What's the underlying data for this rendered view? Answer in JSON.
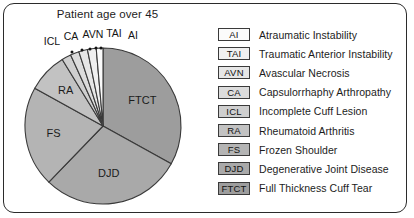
{
  "figure": {
    "background": "#ffffff",
    "border_color": "#2b2b2b"
  },
  "chart_data": {
    "type": "pie",
    "title": "Patient age over 45",
    "xlabel": "",
    "ylabel": "",
    "legend_position": "right",
    "grid": false,
    "start_angle_deg": 0,
    "direction": "clockwise",
    "categories": [
      "FTCT",
      "DJD",
      "FS",
      "RA",
      "ICL",
      "CA",
      "AVN",
      "TAI",
      "AI"
    ],
    "values": [
      33,
      29,
      21,
      8,
      2,
      2,
      2,
      2,
      1
    ],
    "labels_on_slices": [
      "FTCT",
      "DJD",
      "FS",
      "RA"
    ],
    "labels_with_leader_lines": [
      "ICL",
      "CA",
      "AVN",
      "TAI",
      "AI"
    ],
    "slice_colors": [
      "#9d9d9d",
      "#a9a9a9",
      "#b4b4b4",
      "#c2c2c2",
      "#cfcfcf",
      "#dcdcdc",
      "#e6e6e6",
      "#f0f0f0",
      "#fbfbfb"
    ],
    "series": [
      {
        "name": "Patient age over 45",
        "values": [
          33,
          29,
          21,
          8,
          2,
          2,
          2,
          2,
          1
        ]
      }
    ]
  },
  "pie": {
    "center_x": 103,
    "center_y": 126,
    "radius": 78,
    "outline_color": "#3a3a3a",
    "slices": [
      {
        "key": "FTCT",
        "start": 0,
        "end": 119,
        "fill": "#9d9d9d",
        "label": "FTCT",
        "label_r": 47,
        "label_angle": 57
      },
      {
        "key": "DJD",
        "start": 119,
        "end": 224,
        "fill": "#a9a9a9",
        "label": "DJD",
        "label_r": 47,
        "label_angle": 173
      },
      {
        "key": "FS",
        "start": 224,
        "end": 299,
        "fill": "#b4b4b4",
        "label": "FS",
        "label_r": 50,
        "label_angle": 262
      },
      {
        "key": "RA",
        "start": 299,
        "end": 328.5,
        "fill": "#c2c2c2",
        "label": "RA",
        "label_r": 52,
        "label_angle": 314
      },
      {
        "key": "ICL",
        "start": 328.5,
        "end": 335.5,
        "fill": "#cfcfcf",
        "label": "",
        "label_r": 0,
        "label_angle": 0
      },
      {
        "key": "CA",
        "start": 335.5,
        "end": 342,
        "fill": "#dcdcdc",
        "label": "",
        "label_r": 0,
        "label_angle": 0
      },
      {
        "key": "AVN",
        "start": 342,
        "end": 348.5,
        "fill": "#e6e6e6",
        "label": "",
        "label_r": 0,
        "label_angle": 0
      },
      {
        "key": "TAI",
        "start": 348.5,
        "end": 355,
        "fill": "#f0f0f0",
        "label": "",
        "label_r": 0,
        "label_angle": 0
      },
      {
        "key": "AI",
        "start": 355,
        "end": 360,
        "fill": "#fbfbfb",
        "label": "",
        "label_r": 0,
        "label_angle": 0
      }
    ],
    "callouts": [
      {
        "key": "ICL",
        "label": "ICL",
        "text_x": 52,
        "text_y": 45,
        "dot_x": 72,
        "dot_y": 52
      },
      {
        "key": "CA",
        "label": "CA",
        "text_x": 71,
        "text_y": 40,
        "dot_x": 82,
        "dot_y": 50
      },
      {
        "key": "AVN",
        "label": "AVN",
        "text_x": 93,
        "text_y": 38,
        "dot_x": 90,
        "dot_y": 49
      },
      {
        "key": "TAI",
        "label": "TAI",
        "text_x": 114,
        "text_y": 37,
        "dot_x": 96,
        "dot_y": 48
      },
      {
        "key": "AI",
        "label": "AI",
        "text_x": 133,
        "text_y": 39,
        "dot_x": 101,
        "dot_y": 48
      }
    ]
  },
  "legend": {
    "items": [
      {
        "abbr": "AI",
        "name": "Atraumatic Instability",
        "swatch": "#fbfbfb"
      },
      {
        "abbr": "TAI",
        "name": "Traumatic Anterior Instability",
        "swatch": "#f0f0f0"
      },
      {
        "abbr": "AVN",
        "name": "Avascular Necrosis",
        "swatch": "#e6e6e6"
      },
      {
        "abbr": "CA",
        "name": "Capsulorrhaphy Arthropathy",
        "swatch": "#dcdcdc"
      },
      {
        "abbr": "ICL",
        "name": "Incomplete Cuff Lesion",
        "swatch": "#cfcfcf"
      },
      {
        "abbr": "RA",
        "name": "Rheumatoid Arthritis",
        "swatch": "#c2c2c2"
      },
      {
        "abbr": "FS",
        "name": "Frozen Shoulder",
        "swatch": "#b4b4b4"
      },
      {
        "abbr": "DJD",
        "name": "Degenerative Joint Disease",
        "swatch": "#a9a9a9"
      },
      {
        "abbr": "FTCT",
        "name": "Full Thickness Cuff Tear",
        "swatch": "#9d9d9d"
      }
    ]
  }
}
